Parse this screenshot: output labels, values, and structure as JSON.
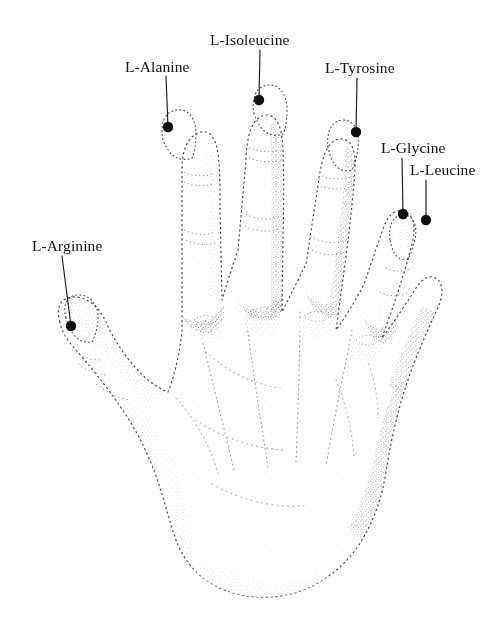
{
  "figure": {
    "title": "",
    "width": 504,
    "height": 622,
    "background_color": "#ffffff",
    "ink_color": "#1a1a1a",
    "marker_color": "#101010",
    "leader_color": "#1a1a1a"
  },
  "annotations": [
    {
      "id": "l-isoleucine",
      "label": "L-Isoleucine",
      "label_x": 210,
      "label_y": 44,
      "leader": {
        "x1": 260,
        "y1": 50,
        "x2": 259,
        "y2": 100
      },
      "marker": {
        "x": 259,
        "y": 100,
        "r": 5.2
      },
      "target": "middle finger tip"
    },
    {
      "id": "l-alanine",
      "label": "L-Alanine",
      "label_x": 125,
      "label_y": 71,
      "leader": {
        "x1": 166,
        "y1": 76,
        "x2": 168,
        "y2": 127
      },
      "marker": {
        "x": 168,
        "y": 127,
        "r": 5.2
      },
      "target": "index finger tip"
    },
    {
      "id": "l-tyrosine",
      "label": "L-Tyrosine",
      "label_x": 325,
      "label_y": 72,
      "leader": {
        "x1": 357,
        "y1": 78,
        "x2": 356,
        "y2": 132
      },
      "marker": {
        "x": 356,
        "y": 132,
        "r": 5.2
      },
      "target": "ring finger tip"
    },
    {
      "id": "l-glycine",
      "label": "L-Glycine",
      "label_x": 381,
      "label_y": 152,
      "leader": {
        "x1": 402,
        "y1": 158,
        "x2": 403,
        "y2": 214
      },
      "marker": {
        "x": 403,
        "y": 214,
        "r": 5.2
      },
      "target": "little finger tip, left side"
    },
    {
      "id": "l-leucine",
      "label": "L-Leucine",
      "label_x": 410,
      "label_y": 174,
      "leader": {
        "x1": 426,
        "y1": 180,
        "x2": 426,
        "y2": 220
      },
      "marker": {
        "x": 426,
        "y": 220,
        "r": 5.2
      },
      "target": "little finger tip, right side"
    },
    {
      "id": "l-arginine",
      "label": "L-Arginine",
      "label_x": 32,
      "label_y": 250,
      "leader": {
        "x1": 62,
        "y1": 256,
        "x2": 71,
        "y2": 326
      },
      "marker": {
        "x": 71,
        "y": 326,
        "r": 5.2
      },
      "target": "thumb tip"
    }
  ]
}
